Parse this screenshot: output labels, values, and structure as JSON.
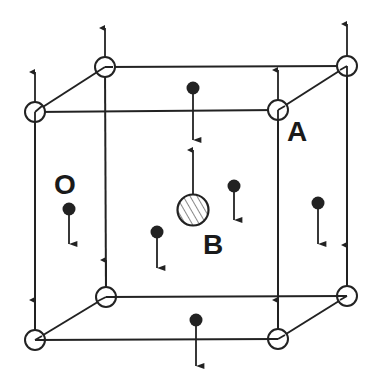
{
  "diagram": {
    "title": "",
    "labels": {
      "A": "A",
      "O": "O",
      "B": "B"
    },
    "colors": {
      "line": "#222222",
      "background": "#ffffff",
      "hatch": "#888888"
    },
    "corners": {
      "front_top_left": [
        35,
        112
      ],
      "front_top_right": [
        278,
        110
      ],
      "front_bottom_left": [
        35,
        340
      ],
      "front_bottom_right": [
        278,
        339
      ],
      "back_top_left": [
        105,
        67
      ],
      "back_top_right": [
        347,
        66
      ],
      "back_bottom_left": [
        106,
        297
      ],
      "back_bottom_right": [
        347,
        296
      ]
    },
    "atoms": [
      {
        "id": "A",
        "type": "open-circle",
        "positions": "cube corners",
        "spin": "up"
      },
      {
        "id": "B",
        "type": "hatched-circle",
        "position": [
          193,
          210
        ],
        "spin": "up"
      },
      {
        "id": "O",
        "type": "filled-dot",
        "positions": "face centers",
        "spin": "down"
      }
    ]
  }
}
